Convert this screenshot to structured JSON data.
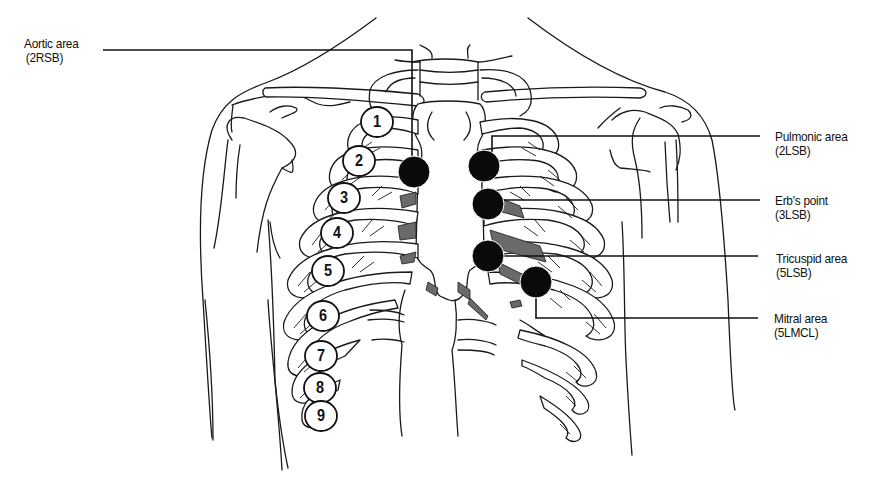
{
  "diagram": {
    "type": "anatomical-line-drawing",
    "colors": {
      "line": "#1a1a1a",
      "dot": "#0a0a0a",
      "cartilage": "#6a6a6a",
      "background": "#ffffff"
    }
  },
  "labels": {
    "aortic": {
      "name": "Aortic area",
      "code": "(2RSB)"
    },
    "pulmonic": {
      "name": "Pulmonic area",
      "code": "(2LSB)"
    },
    "erbs": {
      "name": "Erb's point",
      "code": "(3LSB)"
    },
    "tricuspid": {
      "name": "Tricuspid area",
      "code": "(5LSB)"
    },
    "mitral": {
      "name": "Mitral area",
      "code": "(5LMCL)"
    }
  },
  "ribs": [
    "1",
    "2",
    "3",
    "4",
    "5",
    "6",
    "7",
    "8",
    "9"
  ]
}
